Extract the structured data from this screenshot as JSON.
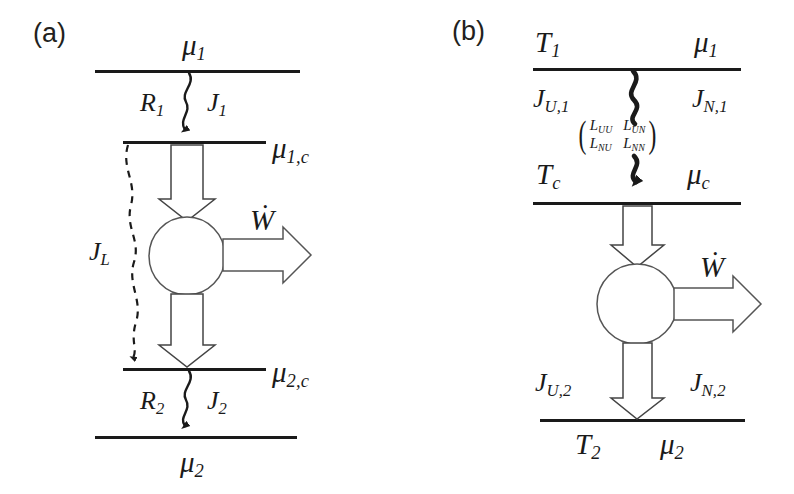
{
  "figure": {
    "width": 794,
    "height": 494,
    "background": "#ffffff",
    "stroke_color": "#1a1a1a",
    "text_color": "#1a1a1a"
  },
  "panel_a": {
    "label": "(a)",
    "reservoir_top_label": "μ",
    "reservoir_top_sub": "1",
    "resistance_1": "R",
    "resistance_1_sub": "1",
    "flux_1": "J",
    "flux_1_sub": "1",
    "contact_top_label": "μ",
    "contact_top_sub": "1,c",
    "leak_flux": "J",
    "leak_flux_sub": "L",
    "work": "Ẇ",
    "contact_bottom_label": "μ",
    "contact_bottom_sub": "2,c",
    "resistance_2": "R",
    "resistance_2_sub": "2",
    "flux_2": "J",
    "flux_2_sub": "2",
    "reservoir_bottom_label": "μ",
    "reservoir_bottom_sub": "2"
  },
  "panel_b": {
    "label": "(b)",
    "temp_hot": "T",
    "temp_hot_sub": "1",
    "mu_hot": "μ",
    "mu_hot_sub": "1",
    "heat_flux_1": "J",
    "heat_flux_1_sub": "U,1",
    "particle_flux_1": "J",
    "particle_flux_1_sub": "N,1",
    "onsager_matrix": {
      "row1": [
        "L",
        "L"
      ],
      "row1_subs": [
        "UU",
        "UN"
      ],
      "row2": [
        "L",
        "L"
      ],
      "row2_subs": [
        "NU",
        "NN"
      ],
      "left_paren": "(",
      "right_paren": ")"
    },
    "temp_contact": "T",
    "temp_contact_sub": "c",
    "mu_contact": "μ",
    "mu_contact_sub": "c",
    "work": "Ẇ",
    "heat_flux_2": "J",
    "heat_flux_2_sub": "U,2",
    "particle_flux_2": "J",
    "particle_flux_2_sub": "N,2",
    "temp_cold": "T",
    "temp_cold_sub": "2",
    "mu_cold": "μ",
    "mu_cold_sub": "2"
  }
}
